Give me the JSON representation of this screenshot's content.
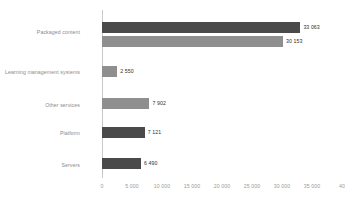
{
  "chart_data": {
    "type": "bar",
    "orientation": "horizontal",
    "title": "",
    "xlabel": "",
    "ylabel": "",
    "xlim": [
      0,
      40000
    ],
    "grid": false,
    "legend": "none",
    "colors": {
      "dark": "#4a4a4a",
      "gray": "#8f8f8f",
      "axis": "#c8c8c8",
      "label_text": "#8a8a8a",
      "value_text": "#2e2e2e",
      "tick_text": "#9a9a9a",
      "background": "#ffffff"
    },
    "categories": [
      "Packaged content",
      "Learning management systems",
      "Other services",
      "Platform",
      "Servers"
    ],
    "bars": [
      {
        "category": "Packaged content",
        "value": 33063,
        "label": "33 063",
        "color": "dark"
      },
      {
        "category": "Packaged content",
        "value": 30153,
        "label": "30 153",
        "color": "gray"
      },
      {
        "category": "Learning management systems",
        "value": 2550,
        "label": "2 550",
        "color": "gray"
      },
      {
        "category": "Other services",
        "value": 7902,
        "label": "7 902",
        "color": "gray"
      },
      {
        "category": "Platform",
        "value": 7121,
        "label": "7 121",
        "color": "dark"
      },
      {
        "category": "Servers",
        "value": 6490,
        "label": "6 490",
        "color": "dark"
      }
    ],
    "xticks": [
      0,
      5000,
      10000,
      15000,
      20000,
      25000,
      30000,
      35000,
      40000
    ],
    "xtick_labels": [
      "0",
      "5 000",
      "10 000",
      "15 000",
      "20 000",
      "25 000",
      "30 000",
      "35 000",
      "40"
    ]
  }
}
